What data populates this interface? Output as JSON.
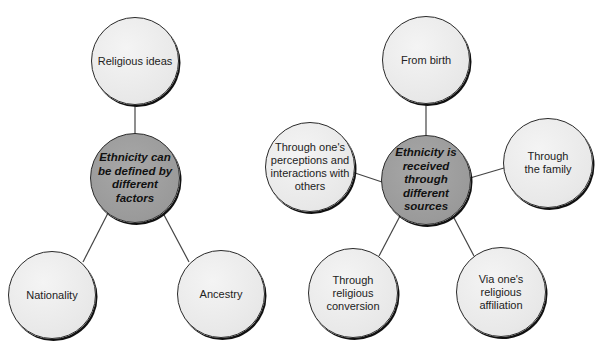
{
  "diagrams": [
    {
      "hub": {
        "label": "Ethnicity can be defined by different factors",
        "lines": [
          "Ethnicity can",
          "be defined by",
          "different factors"
        ]
      },
      "nodes": [
        {
          "id": "religious-ideas",
          "lines": [
            "Religious ideas"
          ]
        },
        {
          "id": "nationality",
          "lines": [
            "Nationality"
          ]
        },
        {
          "id": "ancestry",
          "lines": [
            "Ancestry"
          ]
        }
      ]
    },
    {
      "hub": {
        "label": "Ethnicity is received through different sources",
        "lines": [
          "Ethnicity is",
          "received",
          "through",
          "different",
          "sources"
        ]
      },
      "nodes": [
        {
          "id": "from-birth",
          "lines": [
            "From birth"
          ]
        },
        {
          "id": "perceptions",
          "lines": [
            "Through one's",
            "perceptions and",
            "interactions with",
            "others"
          ]
        },
        {
          "id": "family",
          "lines": [
            "Through",
            "the family"
          ]
        },
        {
          "id": "religious-conversion",
          "lines": [
            "Through",
            "religious",
            "conversion"
          ]
        },
        {
          "id": "religious-affiliation",
          "lines": [
            "Via one's",
            "religious",
            "affiliation"
          ]
        }
      ]
    }
  ],
  "colors": {
    "leaf_fill": "#e8e8e8",
    "hub_fill": "#9a9a9a",
    "stroke": "#2a2a2a",
    "connector": "#444444"
  }
}
